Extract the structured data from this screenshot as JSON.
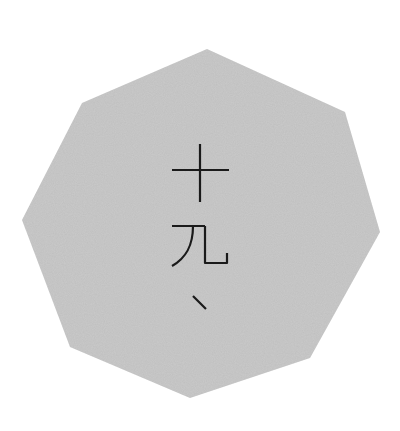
{
  "badge": {
    "shape": "octagon",
    "fill_color": "#c9c9c9",
    "background_color": "#ffffff",
    "text_color": "#1a1a1a",
    "text": "十九、",
    "characters": [
      "十",
      "九",
      "、"
    ],
    "orientation": "vertical"
  }
}
